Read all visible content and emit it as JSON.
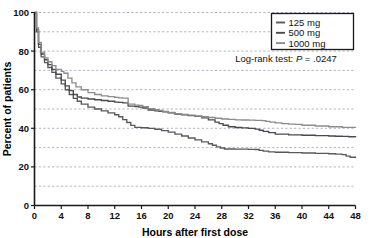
{
  "chart_data": {
    "type": "line",
    "title": "",
    "xlabel": "Hours after first dose",
    "ylabel": "Percent of patients",
    "xlim": [
      0,
      48
    ],
    "ylim": [
      0,
      100
    ],
    "xticks": [
      0,
      4,
      8,
      12,
      16,
      20,
      24,
      28,
      32,
      36,
      40,
      44,
      48
    ],
    "xticklabels": [
      "0",
      "4",
      "8",
      "12",
      "16",
      "20",
      "24",
      "28",
      "32",
      "36",
      "40",
      "44",
      "48"
    ],
    "yticks": [
      0,
      20,
      40,
      60,
      80,
      100
    ],
    "yticklabels": [
      "0",
      "20",
      "40",
      "60",
      "80",
      "100"
    ],
    "grid": "horizontal-dashed-every-10",
    "gridlines_y": [
      10,
      20,
      30,
      40,
      50,
      60,
      70,
      80,
      90,
      100
    ],
    "legend_position": "top-right",
    "annotation": "Log-rank test: P = .0247",
    "annotation_parts": {
      "prefix": "Log-rank test: ",
      "italic": "P",
      "suffix": " = .0247"
    },
    "series": [
      {
        "name": "125 mg",
        "color": "#595959",
        "x": [
          0,
          0.3,
          0.6,
          1.0,
          1.5,
          2.0,
          2.6,
          3.2,
          4.0,
          4.6,
          5.2,
          5.8,
          6.4,
          7.0,
          8.0,
          9.0,
          10.0,
          11.0,
          12.0,
          12.6,
          13.2,
          13.8,
          14.4,
          15.0,
          16.0,
          17.0,
          18.0,
          19.0,
          20.0,
          21.0,
          22.0,
          23.0,
          24.0,
          25.0,
          26.0,
          26.6,
          27.2,
          27.8,
          28.4,
          30.0,
          32.0,
          33.0,
          33.6,
          34.2,
          35.0,
          36.0,
          38.0,
          40.0,
          42.0,
          44.0,
          45.0,
          46.0,
          46.6,
          47.2,
          48.0
        ],
        "y": [
          100,
          90,
          82,
          77,
          74,
          71.5,
          69,
          66,
          63,
          60,
          57.5,
          55.5,
          54,
          52.5,
          51,
          50,
          49,
          48,
          47,
          46,
          44.5,
          43,
          41.5,
          40.5,
          40.3,
          40,
          39.5,
          38.8,
          38,
          37,
          36,
          35,
          34,
          33,
          32,
          31.2,
          30.4,
          29.8,
          29.3,
          29.2,
          29.1,
          29,
          28.6,
          28.2,
          27.8,
          27.6,
          27.4,
          27.2,
          27,
          26.8,
          26.6,
          26.4,
          25.6,
          25,
          24.6
        ]
      },
      {
        "name": "500 mg",
        "color": "#4a4a4a",
        "x": [
          0,
          0.3,
          0.6,
          1.0,
          1.5,
          2.0,
          2.6,
          3.2,
          4.0,
          4.6,
          5.2,
          5.8,
          6.4,
          7.0,
          8.0,
          9.0,
          10.0,
          11.0,
          12.0,
          12.6,
          13.2,
          14.0,
          15.0,
          15.6,
          16.2,
          17.0,
          18.0,
          18.6,
          19.2,
          20.0,
          21.0,
          22.0,
          23.0,
          24.0,
          25.0,
          26.0,
          27.0,
          27.6,
          28.2,
          29.0,
          30.0,
          31.0,
          32.0,
          33.0,
          33.6,
          34.2,
          35.0,
          36.0,
          38.0,
          40.0,
          42.0,
          44.0,
          45.0,
          46.0,
          47.0,
          48.0
        ],
        "y": [
          100,
          91,
          83.5,
          78.5,
          75.5,
          73,
          70.5,
          68,
          65,
          62,
          59.5,
          57.5,
          56.2,
          55.6,
          55.2,
          54.8,
          54.4,
          54,
          53.6,
          53.4,
          53.2,
          51.5,
          51.2,
          51,
          50.5,
          49.5,
          49,
          48.8,
          48.6,
          48,
          47.4,
          47,
          46.6,
          46.2,
          45.4,
          44.4,
          43.2,
          42.4,
          41.6,
          40.8,
          40.4,
          40.2,
          40,
          39.6,
          39,
          38.4,
          37.8,
          37,
          36.6,
          36.4,
          36.2,
          36,
          35.9,
          35.8,
          35.6,
          35.4
        ]
      },
      {
        "name": "1000 mg",
        "color": "#8c8c8c",
        "x": [
          0,
          0.3,
          0.6,
          1.0,
          1.5,
          2.0,
          2.6,
          3.2,
          4.0,
          4.4,
          5.0,
          5.6,
          6.2,
          7.0,
          8.0,
          9.0,
          10.0,
          11.0,
          12.0,
          12.6,
          13.2,
          14.0,
          15.0,
          15.6,
          16.2,
          17.0,
          18.0,
          18.6,
          19.2,
          20.0,
          21.0,
          22.0,
          23.0,
          24.0,
          25.0,
          26.0,
          27.0,
          28.0,
          29.0,
          30.0,
          31.0,
          32.0,
          33.0,
          34.0,
          34.6,
          35.2,
          36.0,
          37.0,
          38.0,
          39.0,
          40.0,
          42.0,
          44.0,
          46.0,
          48.0
        ],
        "y": [
          100,
          92,
          84.5,
          79.5,
          76.5,
          74.5,
          72.5,
          70.5,
          69.5,
          68.5,
          66,
          63.5,
          61.5,
          60,
          58.5,
          57.5,
          56.8,
          56.4,
          56,
          55.8,
          55.6,
          52.5,
          52,
          51.8,
          51.2,
          50.2,
          49.6,
          49.2,
          48.8,
          48.2,
          47.6,
          47.2,
          46.8,
          46.4,
          46,
          45.6,
          45.2,
          44.8,
          44.6,
          44.4,
          44.3,
          44.2,
          44.1,
          44,
          43.6,
          43.2,
          42.8,
          42.4,
          42.2,
          42,
          41.6,
          41.2,
          40.8,
          40.5,
          40.3
        ]
      }
    ]
  },
  "legend": {
    "items": [
      {
        "label": "125 mg"
      },
      {
        "label": "500 mg"
      },
      {
        "label": "1000 mg"
      }
    ]
  }
}
